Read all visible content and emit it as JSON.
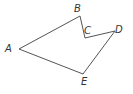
{
  "diagram": {
    "type": "polygon",
    "stroke_color": "#555555",
    "vertices": [
      {
        "name": "A",
        "x": 19,
        "y": 49,
        "label_x": 5,
        "label_y": 52
      },
      {
        "name": "B",
        "x": 80,
        "y": 16,
        "label_x": 74,
        "label_y": 12
      },
      {
        "name": "C",
        "x": 85,
        "y": 38,
        "label_x": 84,
        "label_y": 34
      },
      {
        "name": "D",
        "x": 115,
        "y": 31,
        "label_x": 115,
        "label_y": 33
      },
      {
        "name": "E",
        "x": 83,
        "y": 74,
        "label_x": 81,
        "label_y": 85
      }
    ],
    "labels": {
      "a": "A",
      "b": "B",
      "c": "C",
      "d": "D",
      "e": "E"
    }
  }
}
